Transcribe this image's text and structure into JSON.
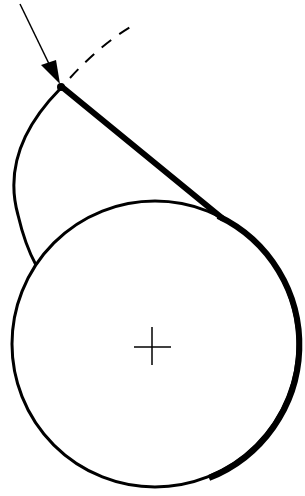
{
  "diagram": {
    "title": "",
    "background": "#ffffff",
    "stroke_color": "#000000",
    "circle": {
      "cx": 155,
      "cy": 344,
      "r": 143,
      "stroke_width": 3
    },
    "center_mark": {
      "x": 152,
      "y": 347,
      "size": 18
    },
    "tangent_point": {
      "x": 62,
      "y": 87
    },
    "elements": [
      {
        "name": "incoming-arrow",
        "label": ""
      },
      {
        "name": "dashed-arc",
        "label": ""
      },
      {
        "name": "tangent-line-thick",
        "label": ""
      },
      {
        "name": "curved-arc-left",
        "label": ""
      },
      {
        "name": "circle",
        "label": ""
      },
      {
        "name": "center-crosshair",
        "label": ""
      }
    ]
  }
}
